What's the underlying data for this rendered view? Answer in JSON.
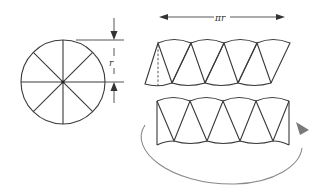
{
  "figure": {
    "circle": {
      "sectors": 8
    },
    "labels": {
      "radius": "r",
      "length": "πr"
    },
    "rows": [
      {
        "name": "alternating-sectors-row",
        "sector_pairs": 4
      },
      {
        "name": "rearranged-rectangle-row",
        "sector_pairs": 4
      }
    ],
    "colors": {
      "line": "#3a3a3a",
      "curved_arrow": "#8a8a8a"
    }
  }
}
